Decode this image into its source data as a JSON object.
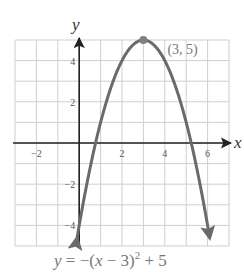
{
  "chart_data": {
    "type": "line",
    "title": "",
    "xlabel": "x",
    "ylabel": "y",
    "xlim": [
      -3,
      7
    ],
    "ylim": [
      -5,
      5
    ],
    "grid": true,
    "x_ticks": [
      -2,
      2,
      4,
      6
    ],
    "x_tick_labels": [
      "−2",
      "2",
      "4",
      "6"
    ],
    "y_ticks": [
      4,
      2,
      -2,
      -4
    ],
    "y_tick_labels": [
      "4",
      "2",
      "−2",
      "−4"
    ],
    "series": [
      {
        "name": "y = -(x - 3)^2 + 5",
        "equation": "y = -(x - 3)^2 + 5",
        "x": [
          -0.1,
          0,
          0.5,
          1,
          1.5,
          2,
          2.5,
          3,
          3.5,
          4,
          4.5,
          5,
          5.5,
          6,
          6.1
        ],
        "y": [
          -4.61,
          -4,
          -1.25,
          1,
          2.75,
          4,
          4.75,
          5,
          4.75,
          4,
          2.75,
          1,
          -1.25,
          -4,
          -4.61
        ],
        "arrows_at_ends": true,
        "color": "#6a6a6a"
      }
    ],
    "annotations": [
      {
        "type": "point",
        "x": 3,
        "y": 5,
        "label": "(3, 5)"
      }
    ],
    "caption_parts": {
      "lhs": "y",
      "eq": " = −(",
      "var": "x",
      "mid": " − 3)",
      "exp": "2",
      "rhs": " + 5"
    }
  },
  "colors": {
    "grid": "#cfcfcf",
    "axis": "#222222",
    "curve": "#6a6a6a",
    "vertex": "#808080"
  }
}
